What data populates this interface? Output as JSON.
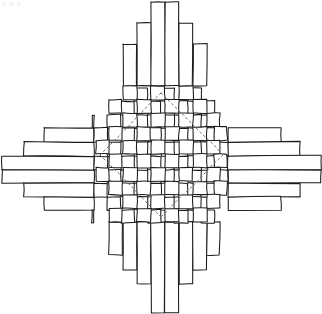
{
  "figure": {
    "style": "hand-drawn line drawing",
    "background_color": "#ffffff",
    "stroke_color": "#1a1a1a",
    "fill_color": "#ffffff",
    "dashed_color": "#6e6e6e",
    "canvas": {
      "width": 322,
      "height": 314
    }
  },
  "weave": {
    "vertical_strip_count": 10,
    "horizontal_strip_count": 10,
    "pattern": "over-under checkerboard (plain weave)",
    "grid_left": 94,
    "grid_top": 86,
    "grid_right": 228,
    "grid_bottom": 222,
    "cell_width": 13.4,
    "cell_height": 13.6
  },
  "vertical_strips": [
    {
      "index": 0,
      "x": 96,
      "width": 13,
      "top": 129,
      "bottom": 186,
      "over_parity": 0
    },
    {
      "index": 1,
      "x": 109,
      "width": 13,
      "top": 101,
      "bottom": 255,
      "over_parity": 1
    },
    {
      "index": 2,
      "x": 123,
      "width": 14,
      "top": 44,
      "bottom": 270,
      "over_parity": 0
    },
    {
      "index": 3,
      "x": 137,
      "width": 14,
      "top": 23,
      "bottom": 284,
      "over_parity": 1
    },
    {
      "index": 4,
      "x": 151,
      "width": 14,
      "top": 2,
      "bottom": 313,
      "over_parity": 0
    },
    {
      "index": 5,
      "x": 165,
      "width": 14,
      "top": 2,
      "bottom": 313,
      "over_parity": 1
    },
    {
      "index": 6,
      "x": 179,
      "width": 14,
      "top": 23,
      "bottom": 284,
      "over_parity": 0
    },
    {
      "index": 7,
      "x": 193,
      "width": 14,
      "top": 44,
      "bottom": 270,
      "over_parity": 1
    },
    {
      "index": 8,
      "x": 207,
      "width": 13,
      "top": 101,
      "bottom": 255,
      "over_parity": 0
    },
    {
      "index": 9,
      "x": 214,
      "width": 13,
      "top": 129,
      "bottom": 186,
      "over_parity": 1
    }
  ],
  "horizontal_strips": [
    {
      "index": 0,
      "y": 88,
      "height": 13,
      "left": 123,
      "right": 199,
      "over_parity": 1
    },
    {
      "index": 1,
      "y": 101,
      "height": 14,
      "left": 107,
      "right": 213,
      "over_parity": 0
    },
    {
      "index": 2,
      "y": 115,
      "height": 13,
      "left": 92,
      "right": 228,
      "over_parity": 1
    },
    {
      "index": 3,
      "y": 128,
      "height": 14,
      "left": 44,
      "right": 281,
      "over_parity": 0
    },
    {
      "index": 4,
      "y": 142,
      "height": 14,
      "left": 24,
      "right": 300,
      "over_parity": 1
    },
    {
      "index": 5,
      "y": 156,
      "height": 14,
      "left": 2,
      "right": 321,
      "over_parity": 0
    },
    {
      "index": 6,
      "y": 170,
      "height": 13,
      "left": 2,
      "right": 321,
      "over_parity": 1
    },
    {
      "index": 7,
      "y": 183,
      "height": 14,
      "left": 24,
      "right": 300,
      "over_parity": 0
    },
    {
      "index": 8,
      "y": 197,
      "height": 13,
      "left": 44,
      "right": 281,
      "over_parity": 1
    },
    {
      "index": 9,
      "y": 210,
      "height": 13,
      "left": 92,
      "right": 228,
      "over_parity": 0
    }
  ],
  "dashed_diamond": {
    "label": "inner diamond guide",
    "stroke": "#6e6e6e",
    "dash_pattern": "2 3",
    "top_vertex": {
      "x": 161,
      "y": 93
    },
    "right_vertex": {
      "x": 223,
      "y": 155
    },
    "bottom_vertex": {
      "x": 161,
      "y": 217
    },
    "left_vertex": {
      "x": 100,
      "y": 155
    }
  },
  "scan_artifact": {
    "label": "faint scan speckle",
    "x": 2,
    "y": 2,
    "width": 22,
    "height": 4
  }
}
